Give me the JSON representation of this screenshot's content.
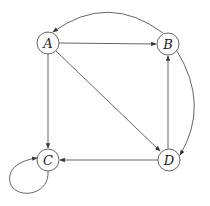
{
  "diagram": {
    "type": "directed-graph",
    "nodes": [
      {
        "id": "A",
        "label": "A",
        "x": 48,
        "y": 43
      },
      {
        "id": "B",
        "label": "B",
        "x": 168,
        "y": 44
      },
      {
        "id": "C",
        "label": "C",
        "x": 48,
        "y": 160
      },
      {
        "id": "D",
        "label": "D",
        "x": 169,
        "y": 160
      }
    ],
    "edges": [
      {
        "from": "A",
        "to": "B",
        "shape": "straight"
      },
      {
        "from": "A",
        "to": "D",
        "shape": "straight"
      },
      {
        "from": "A",
        "to": "C",
        "shape": "straight"
      },
      {
        "from": "D",
        "to": "C",
        "shape": "straight"
      },
      {
        "from": "D",
        "to": "B",
        "shape": "straight"
      },
      {
        "from": "B",
        "to": "D",
        "shape": "curved"
      },
      {
        "from": "B",
        "to": "A",
        "shape": "curved"
      },
      {
        "from": "C",
        "to": "C",
        "shape": "self-loop"
      }
    ],
    "colors": {
      "stroke": "#555555",
      "label": "#222222",
      "background": "#ffffff"
    }
  }
}
